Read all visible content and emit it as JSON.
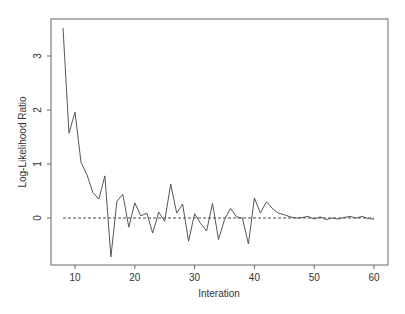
{
  "chart_data": {
    "type": "line",
    "title": "",
    "xlabel": "Interation",
    "ylabel": "Log-Likelihood Ratio",
    "xlim": [
      6,
      62
    ],
    "ylim": [
      -0.9,
      3.7
    ],
    "xticks": [
      10,
      20,
      30,
      40,
      50,
      60
    ],
    "yticks": [
      0,
      1,
      2,
      3
    ],
    "grid": false,
    "legend": null,
    "reference_line": {
      "y": 0,
      "style": "dashed",
      "x_from": 8,
      "x_to": 60
    },
    "series": [
      {
        "name": "log-likelihood ratio",
        "x": [
          8,
          9,
          10,
          11,
          12,
          13,
          14,
          15,
          16,
          17,
          18,
          19,
          20,
          21,
          22,
          23,
          24,
          25,
          26,
          27,
          28,
          29,
          30,
          31,
          32,
          33,
          34,
          35,
          36,
          37,
          38,
          39,
          40,
          41,
          42,
          43,
          44,
          45,
          46,
          47,
          48,
          49,
          50,
          51,
          52,
          53,
          54,
          55,
          56,
          57,
          58,
          59,
          60
        ],
        "values": [
          3.52,
          1.57,
          1.96,
          1.03,
          0.8,
          0.47,
          0.35,
          0.78,
          -0.72,
          0.31,
          0.44,
          -0.17,
          0.28,
          0.04,
          0.09,
          -0.28,
          0.11,
          -0.06,
          0.63,
          0.09,
          0.26,
          -0.43,
          0.08,
          -0.1,
          -0.24,
          0.27,
          -0.4,
          -0.03,
          0.18,
          0.02,
          0.0,
          -0.48,
          0.37,
          0.09,
          0.3,
          0.18,
          0.09,
          0.06,
          0.02,
          0.0,
          0.01,
          0.03,
          -0.02,
          0.02,
          -0.03,
          0.0,
          -0.02,
          0.01,
          0.03,
          0.0,
          0.03,
          -0.01,
          -0.02
        ]
      }
    ]
  }
}
